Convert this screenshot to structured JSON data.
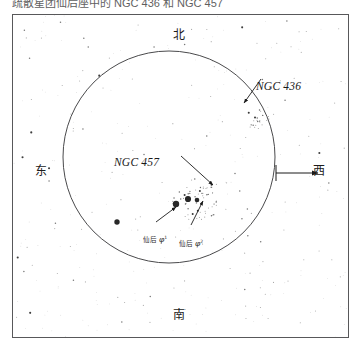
{
  "caption": {
    "text": "疏散星团仙后座中的 NGC 436 和 NGC 457"
  },
  "chart": {
    "frame": {
      "x": 12,
      "y": 14,
      "width": 337,
      "height": 324
    },
    "field_circle": {
      "cx": 168,
      "cy": 156,
      "r": 106
    },
    "background_color": "#ffffff",
    "line_color": "#58585a",
    "star_color": "#1c1c1c"
  },
  "cardinals": {
    "north": "北",
    "south": "南",
    "east": "东",
    "west": "西"
  },
  "objects": [
    {
      "name": "NGC 436",
      "label": "NGC 436"
    },
    {
      "name": "NGC 457",
      "label": "NGC 457"
    }
  ],
  "star_labels": [
    {
      "constellation": "仙后",
      "greek": "φ",
      "superscript": "1"
    },
    {
      "constellation": "仙后",
      "greek": "φ",
      "superscript": "2"
    }
  ],
  "chart_data": {
    "type": "scatter",
    "title": "疏散星团仙后座中的 NGC 436 和 NGC 457",
    "xlabel": "",
    "ylabel": "",
    "grid": false,
    "legend": null,
    "projection": "finder-chart",
    "orientation": {
      "top": "北",
      "bottom": "南",
      "left": "东",
      "right": "西"
    },
    "field_of_view_circle": {
      "cx": 168,
      "cy": 156,
      "r": 106
    },
    "annotations": [
      {
        "text": "NGC 436",
        "x": 243,
        "y": 71,
        "arrow_to": [
          272,
          101
        ]
      },
      {
        "text": "NGC 457",
        "x": 101,
        "y": 147,
        "arrow_to": [
          212,
          198
        ]
      },
      {
        "text": "仙后 φ1",
        "x": 130,
        "y": 222,
        "arrow_to": [
          175,
          205
        ]
      },
      {
        "text": "仙后 φ2",
        "x": 166,
        "y": 226,
        "arrow_to": [
          186,
          200
        ]
      }
    ],
    "direction_arrow": {
      "from": [
        275,
        172
      ],
      "to": [
        320,
        172
      ],
      "label": "西"
    },
    "bright_stars": [
      {
        "x": 175,
        "y": 203,
        "mag": 5.0
      },
      {
        "x": 187,
        "y": 198,
        "mag": 5.2
      },
      {
        "x": 116,
        "y": 221,
        "mag": 5.8
      },
      {
        "x": 196,
        "y": 199,
        "mag": 6.4
      }
    ],
    "clusters": [
      {
        "name": "NGC 457",
        "x": 196,
        "y": 199,
        "n_stars": 60,
        "radius": 26
      },
      {
        "name": "NGC 436",
        "x": 255,
        "y": 118,
        "n_stars": 22,
        "radius": 13
      }
    ],
    "field_star_count": 340
  }
}
